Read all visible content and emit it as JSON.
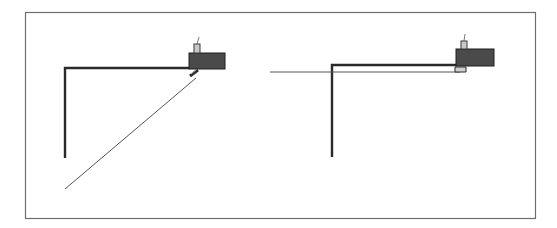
{
  "figure": {
    "frame_color": "#6e6e6e",
    "colors": {
      "boom": "#2a2a2a",
      "block": "#4a4a4a",
      "block_outline": "#1e1e1e",
      "post": "#c8c8c8",
      "line": "#555555"
    },
    "panels": [
      {
        "name": "left-view",
        "boom": {
          "x_vertical": 65,
          "y_bottom": 158,
          "y_top": 68,
          "x_end": 190
        },
        "block": {
          "x": 189,
          "y": 53,
          "w": 36,
          "h": 16
        },
        "post": {
          "x": 194,
          "y": 44,
          "w": 6,
          "h": 9
        },
        "antenna": {
          "x1": 197,
          "y1": 44,
          "x2": 199,
          "y2": 37
        },
        "fitting": {
          "x1": 190,
          "y1": 76,
          "x2": 198,
          "y2": 70
        },
        "line": {
          "x1": 196,
          "y1": 78,
          "x2": 65,
          "y2": 189,
          "orientation": "diagonal"
        }
      },
      {
        "name": "right-view",
        "boom": {
          "x_vertical": 332,
          "y_bottom": 157,
          "y_top": 65,
          "x_end": 457
        },
        "block": {
          "x": 456,
          "y": 49,
          "w": 38,
          "h": 17
        },
        "post": {
          "x": 461,
          "y": 41,
          "w": 6,
          "h": 8
        },
        "antenna": {
          "x1": 464,
          "y1": 41,
          "x2": 465,
          "y2": 34
        },
        "fitting": {
          "x": 455,
          "y": 66,
          "w": 12,
          "h": 6
        },
        "line": {
          "x1": 460,
          "y1": 72,
          "x2": 270,
          "y2": 72,
          "orientation": "horizontal"
        }
      }
    ]
  }
}
